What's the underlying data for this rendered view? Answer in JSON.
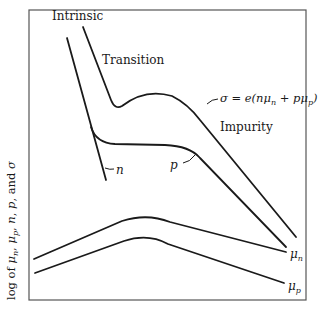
{
  "diagram": {
    "y_axis_label": {
      "prefix": "log of ",
      "mu": "μ",
      "sub_n": "n",
      "sub_p": "p",
      "suffix_parts": [
        ", ",
        ", ",
        "n",
        ", ",
        "p",
        ", and ",
        "σ"
      ]
    },
    "regions": {
      "intrinsic": "Intrinsic",
      "transition": "Transition",
      "impurity": "Impurity"
    },
    "curve_labels": {
      "n": "n",
      "p": "p",
      "sigma_equation": {
        "lhs": "σ = e(nμ",
        "sub_n": "n",
        "mid": " + pμ",
        "sub_p": "p",
        "rhs": ")"
      },
      "mu_n": {
        "mu": "μ",
        "sub": "n"
      },
      "mu_p": {
        "mu": "μ",
        "sub": "p"
      }
    },
    "colors": {
      "ink": "#1a1a1a",
      "frame": "#555555",
      "background": "#ffffff"
    }
  }
}
